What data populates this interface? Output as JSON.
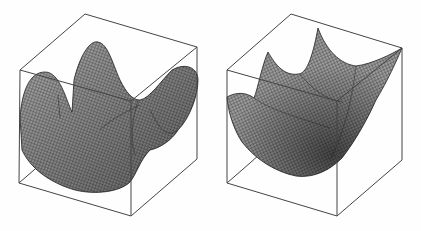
{
  "figure": {
    "panels": [
      {
        "id": "left",
        "description": "3D wireframe surface with saddle-like multi-lobed shape inside bounding cube"
      },
      {
        "id": "right",
        "description": "3D wireframe paraboloid bowl surface inside bounding cube"
      }
    ],
    "colors": {
      "background": "#fefefe",
      "box": "#444444",
      "surface_fill": "#9a9a9a",
      "mesh": "#222222"
    }
  }
}
